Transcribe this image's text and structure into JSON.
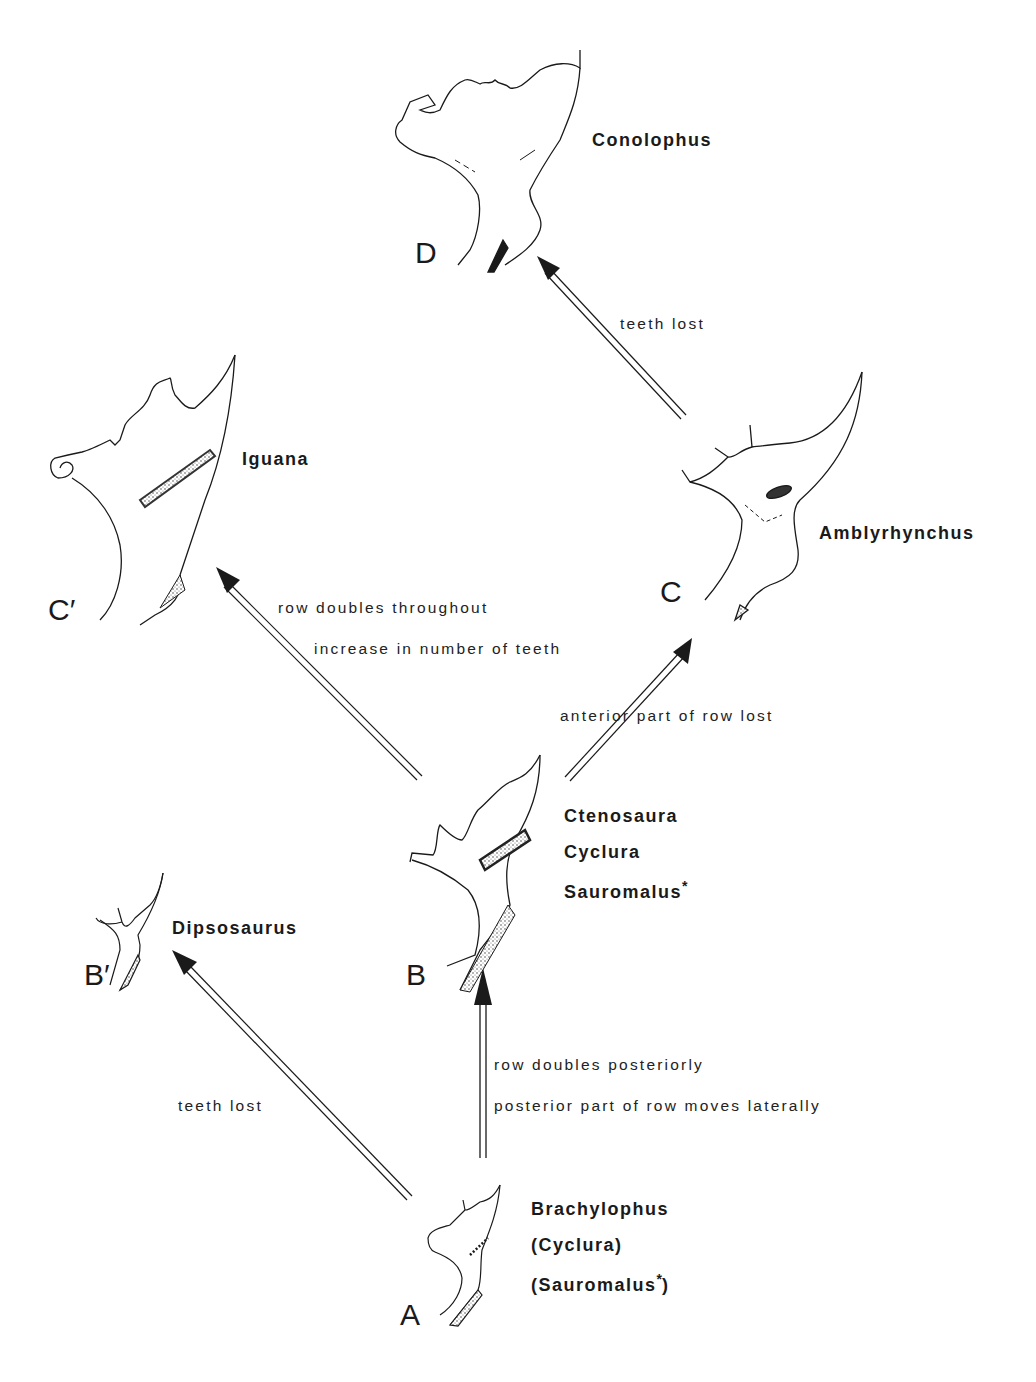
{
  "nodes": {
    "A": {
      "stage": "A",
      "genera": [
        "Brachylophus",
        "(Cyclura)",
        "(Sauromalus"
      ],
      "suffix_mark": "*",
      "closing": ")"
    },
    "B": {
      "stage": "B",
      "genera": [
        "Ctenosaura",
        "Cyclura",
        "Sauromalus"
      ],
      "suffix_mark": "*"
    },
    "B_prime": {
      "stage": "B′",
      "genera": [
        "Dipsosaurus"
      ]
    },
    "C": {
      "stage": "C",
      "genera": [
        "Amblyrhynchus"
      ]
    },
    "C_prime": {
      "stage": "C′",
      "genera": [
        "Iguana"
      ]
    },
    "D": {
      "stage": "D",
      "genera": [
        "Conolophus"
      ]
    }
  },
  "transitions": {
    "A_to_B": [
      "row doubles posteriorly",
      "posterior part of row moves laterally"
    ],
    "A_to_B_prime": [
      "teeth lost"
    ],
    "B_to_C": [
      "anterior part of row lost"
    ],
    "B_to_C_prime": [
      "row doubles throughout",
      "increase in number of teeth"
    ],
    "C_to_D": [
      "teeth lost"
    ]
  },
  "colors": {
    "ink": "#1a1a1a",
    "stipple": "#888888",
    "background": "#ffffff"
  }
}
